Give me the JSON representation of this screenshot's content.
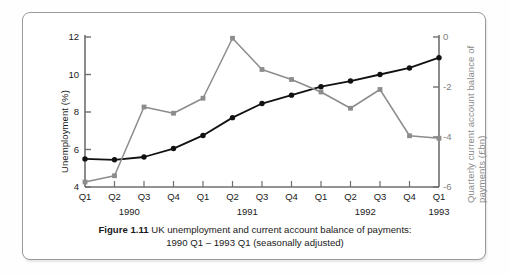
{
  "figure": {
    "caption_label": "Figure 1.11",
    "caption_line1": "UK unemployment and current account balance of payments:",
    "caption_line2": "1990 Q1 – 1993 Q1 (seasonally adjusted)"
  },
  "colors": {
    "unemployment_series": "#111111",
    "balance_series": "#8c8c8c",
    "axis": "#6f6f6f",
    "frame": "#9a9a9a",
    "background": "#ffffff"
  },
  "chart_data": {
    "type": "line",
    "title": "UK unemployment and current account balance of payments: 1990 Q1 – 1993 Q1 (seasonally adjusted)",
    "xlabel": "",
    "grid": false,
    "legend_position": "none",
    "categories": [
      "Q1",
      "Q2",
      "Q3",
      "Q4",
      "Q1",
      "Q2",
      "Q3",
      "Q4",
      "Q1",
      "Q2",
      "Q3",
      "Q4",
      "Q1"
    ],
    "year_groups": [
      {
        "label": "1990",
        "start_index": 0,
        "end_index": 3
      },
      {
        "label": "1991",
        "start_index": 4,
        "end_index": 7
      },
      {
        "label": "1992",
        "start_index": 8,
        "end_index": 11
      },
      {
        "label": "1993",
        "start_index": 12,
        "end_index": 12
      }
    ],
    "axes": {
      "left": {
        "label": "Unemployment (%)",
        "ticks": [
          4,
          6,
          8,
          10,
          12
        ],
        "ylim": [
          4,
          12
        ]
      },
      "right": {
        "label": "Quarterly current account balance of payments (£bn)",
        "ticks": [
          0,
          -2,
          -4,
          -6
        ],
        "ylim": [
          -6,
          0
        ]
      }
    },
    "series": [
      {
        "name": "Unemployment (%)",
        "axis": "left",
        "color": "#111111",
        "marker": "circle",
        "values": [
          5.5,
          5.45,
          5.6,
          6.05,
          6.75,
          7.7,
          8.45,
          8.9,
          9.35,
          9.65,
          10.0,
          10.35,
          10.9
        ]
      },
      {
        "name": "Quarterly current account balance of payments (£bn)",
        "axis": "right",
        "color": "#8c8c8c",
        "marker": "square",
        "values": [
          -5.8,
          -5.55,
          -2.8,
          -3.05,
          -2.45,
          -0.05,
          -1.3,
          -1.7,
          -2.2,
          -2.85,
          -2.1,
          -3.95,
          -4.05
        ]
      }
    ]
  }
}
